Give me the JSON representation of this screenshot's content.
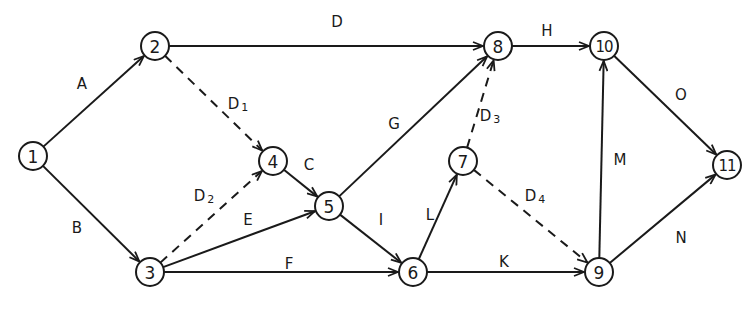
{
  "diagram": {
    "type": "activity-on-arrow network",
    "nodes": [
      {
        "id": "1",
        "label": "1",
        "x": 33,
        "y": 156
      },
      {
        "id": "2",
        "label": "2",
        "x": 155,
        "y": 46
      },
      {
        "id": "3",
        "label": "3",
        "x": 150,
        "y": 272
      },
      {
        "id": "4",
        "label": "4",
        "x": 273,
        "y": 161
      },
      {
        "id": "5",
        "label": "5",
        "x": 329,
        "y": 206
      },
      {
        "id": "6",
        "label": "6",
        "x": 413,
        "y": 272
      },
      {
        "id": "7",
        "label": "7",
        "x": 463,
        "y": 161
      },
      {
        "id": "8",
        "label": "8",
        "x": 498,
        "y": 46
      },
      {
        "id": "9",
        "label": "9",
        "x": 599,
        "y": 272
      },
      {
        "id": "10",
        "label": "10",
        "x": 604,
        "y": 46
      },
      {
        "id": "11",
        "label": "11",
        "x": 727,
        "y": 165
      }
    ],
    "edges": [
      {
        "from": "1",
        "to": "2",
        "label": "A",
        "sub": "",
        "dummy": false,
        "lx": 82,
        "ly": 84
      },
      {
        "from": "1",
        "to": "3",
        "label": "B",
        "sub": "",
        "dummy": false,
        "lx": 77,
        "ly": 228
      },
      {
        "from": "2",
        "to": "8",
        "label": "D",
        "sub": "",
        "dummy": false,
        "lx": 337,
        "ly": 22
      },
      {
        "from": "2",
        "to": "4",
        "label": "D",
        "sub": "1",
        "dummy": true,
        "lx": 238,
        "ly": 104
      },
      {
        "from": "3",
        "to": "4",
        "label": "D",
        "sub": "2",
        "dummy": true,
        "lx": 204,
        "ly": 196
      },
      {
        "from": "4",
        "to": "5",
        "label": "C",
        "sub": "",
        "dummy": false,
        "lx": 309,
        "ly": 165
      },
      {
        "from": "3",
        "to": "5",
        "label": "E",
        "sub": "",
        "dummy": false,
        "lx": 248,
        "ly": 220
      },
      {
        "from": "3",
        "to": "6",
        "label": "F",
        "sub": "",
        "dummy": false,
        "lx": 289,
        "ly": 264
      },
      {
        "from": "5",
        "to": "8",
        "label": "G",
        "sub": "",
        "dummy": false,
        "lx": 394,
        "ly": 124
      },
      {
        "from": "5",
        "to": "6",
        "label": "I",
        "sub": "",
        "dummy": false,
        "lx": 381,
        "ly": 220
      },
      {
        "from": "7",
        "to": "8",
        "label": "D",
        "sub": "3",
        "dummy": true,
        "lx": 490,
        "ly": 116
      },
      {
        "from": "6",
        "to": "7",
        "label": "L",
        "sub": "",
        "dummy": false,
        "lx": 430,
        "ly": 215
      },
      {
        "from": "7",
        "to": "9",
        "label": "D",
        "sub": "4",
        "dummy": true,
        "lx": 535,
        "ly": 196
      },
      {
        "from": "6",
        "to": "9",
        "label": "K",
        "sub": "",
        "dummy": false,
        "lx": 504,
        "ly": 262
      },
      {
        "from": "8",
        "to": "10",
        "label": "H",
        "sub": "",
        "dummy": false,
        "lx": 547,
        "ly": 31
      },
      {
        "from": "9",
        "to": "10",
        "label": "M",
        "sub": "",
        "dummy": false,
        "lx": 620,
        "ly": 160
      },
      {
        "from": "10",
        "to": "11",
        "label": "O",
        "sub": "",
        "dummy": false,
        "lx": 681,
        "ly": 95
      },
      {
        "from": "9",
        "to": "11",
        "label": "N",
        "sub": "",
        "dummy": false,
        "lx": 681,
        "ly": 238
      }
    ]
  },
  "colors": {
    "ink": "#1a1a1a",
    "background": "#ffffff"
  }
}
